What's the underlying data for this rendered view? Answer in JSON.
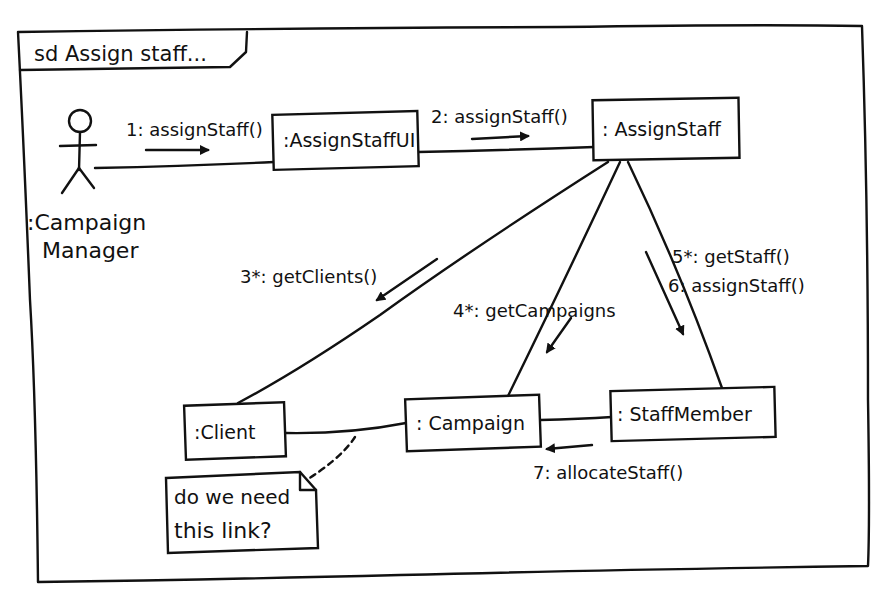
{
  "frame": {
    "tag": "sd Assign staff..."
  },
  "actor": {
    "label_line1": ":Campaign",
    "label_line2": "Manager"
  },
  "objects": {
    "assign_staff_ui": ":AssignStaffUI",
    "assign_staff": ": AssignStaff",
    "client": ":Client",
    "campaign": ": Campaign",
    "staff_member": ": StaffMember"
  },
  "messages": {
    "m1": "1: assignStaff()",
    "m2": "2: assignStaff()",
    "m3": "3*: getClients()",
    "m4": "4*: getCampaigns",
    "m5": "5*: getStaff()",
    "m6": "6: assignStaff()",
    "m7": "7: allocateStaff()"
  },
  "note": {
    "line1": "do we need",
    "line2": "this link?"
  },
  "colors": {
    "ink": "#111111",
    "paper": "#ffffff"
  }
}
